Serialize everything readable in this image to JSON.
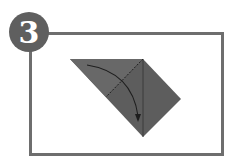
{
  "diagram": {
    "step_number": "3",
    "colors": {
      "background": "#ffffff",
      "frame": "#6e6e6e",
      "badge": "#5f5f5f",
      "badge_text": "#ffffff",
      "paper": "#5d5d5d",
      "lines": "#1e1e1e"
    },
    "shapes": {
      "paper_polygon": "70,59 143,59 181,99 143,137",
      "fold_line_dashed": {
        "x1": 143,
        "y1": 59,
        "x2": 106,
        "y2": 97
      },
      "crease_line": {
        "x1": 143,
        "y1": 59,
        "x2": 143,
        "y2": 137
      },
      "arrow_path": "M87,65 Q132,72 138,118"
    }
  }
}
